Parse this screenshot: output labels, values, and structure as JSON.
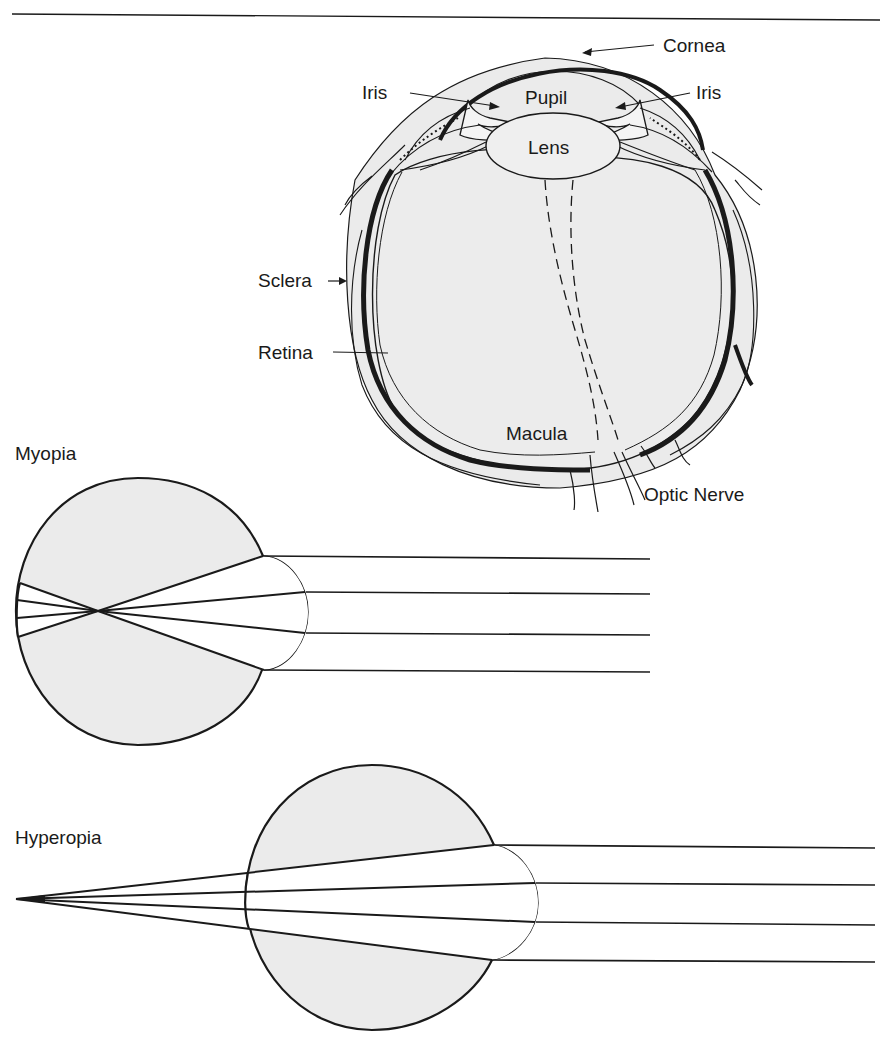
{
  "figure": {
    "header_rule": true,
    "colors": {
      "ink": "#1a1a1a",
      "shading": "#ebebeb",
      "background": "#ffffff"
    }
  },
  "eye_anatomy": {
    "labels": {
      "cornea": "Cornea",
      "iris_left": "Iris",
      "iris_right": "Iris",
      "pupil": "Pupil",
      "lens": "Lens",
      "sclera": "Sclera",
      "retina": "Retina",
      "macula": "Macula",
      "optic_nerve": "Optic Nerve"
    }
  },
  "myopia": {
    "title": "Myopia",
    "ray_count": 4,
    "focus": "in front of retina"
  },
  "hyperopia": {
    "title": "Hyperopia",
    "ray_count": 4,
    "focus": "behind retina"
  }
}
